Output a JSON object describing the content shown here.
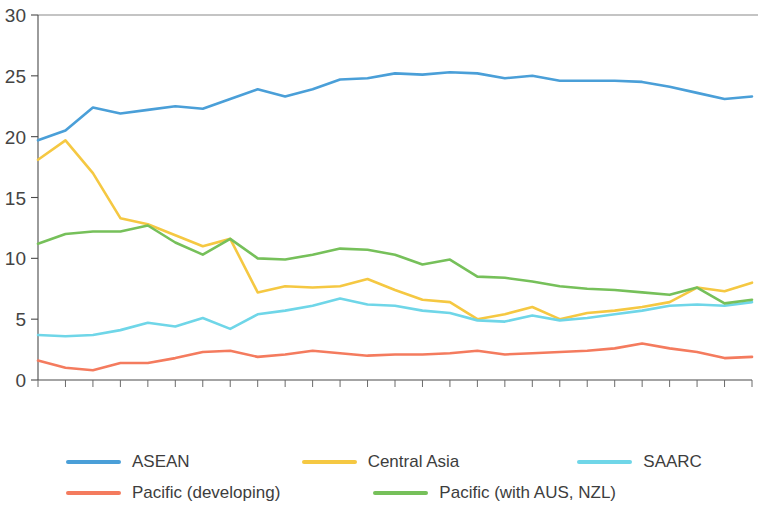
{
  "chart_data": {
    "type": "line",
    "title": "",
    "xlabel": "",
    "ylabel": "",
    "ylim": [
      0,
      30
    ],
    "y_ticks": [
      0,
      5,
      10,
      15,
      20,
      25,
      30
    ],
    "grid": false,
    "legend_position": "bottom",
    "categories": [
      "1992",
      "1993",
      "1994",
      "1995",
      "1996",
      "1997",
      "1998",
      "1999",
      "2000",
      "2001",
      "2002",
      "2003",
      "2004",
      "2005",
      "2006",
      "2007",
      "2008",
      "2009",
      "2010",
      "2011",
      "2012",
      "2013",
      "2014",
      "2015",
      "2016",
      "2017",
      "2018"
    ],
    "series": [
      {
        "name": "ASEAN",
        "color": "#4a9fd8",
        "values": [
          19.7,
          20.5,
          22.4,
          21.9,
          22.2,
          22.5,
          22.3,
          23.1,
          23.9,
          23.3,
          23.9,
          24.7,
          24.8,
          25.2,
          25.1,
          25.3,
          25.2,
          24.8,
          25.0,
          24.6,
          24.6,
          24.6,
          24.5,
          24.1,
          23.6,
          23.1,
          23.3
        ]
      },
      {
        "name": "Central Asia",
        "color": "#f5c842",
        "values": [
          18.1,
          19.7,
          17.0,
          13.3,
          12.8,
          11.9,
          11.0,
          11.6,
          7.2,
          7.7,
          7.6,
          7.7,
          8.3,
          7.4,
          6.6,
          6.4,
          5.0,
          5.4,
          6.0,
          5.0,
          5.5,
          5.7,
          6.0,
          6.4,
          7.6,
          7.3,
          8.0
        ]
      },
      {
        "name": "SAARC",
        "color": "#6fd6e8",
        "values": [
          3.7,
          3.6,
          3.7,
          4.1,
          4.7,
          4.4,
          5.1,
          4.2,
          5.4,
          5.7,
          6.1,
          6.7,
          6.2,
          6.1,
          5.7,
          5.5,
          4.9,
          4.8,
          5.3,
          4.9,
          5.1,
          5.4,
          5.7,
          6.1,
          6.2,
          6.1,
          6.4
        ]
      },
      {
        "name": "Pacific (developing)",
        "color": "#f47b5e",
        "values": [
          1.6,
          1.0,
          0.8,
          1.4,
          1.4,
          1.8,
          2.3,
          2.4,
          1.9,
          2.1,
          2.4,
          2.2,
          2.0,
          2.1,
          2.1,
          2.2,
          2.4,
          2.1,
          2.2,
          2.3,
          2.4,
          2.6,
          3.0,
          2.6,
          2.3,
          1.8,
          1.9
        ]
      },
      {
        "name": "Pacific (with AUS, NZL)",
        "color": "#76c05a",
        "values": [
          11.2,
          12.0,
          12.2,
          12.2,
          12.7,
          11.3,
          10.3,
          11.6,
          10.0,
          9.9,
          10.3,
          10.8,
          10.7,
          10.3,
          9.5,
          9.9,
          8.5,
          8.4,
          8.1,
          7.7,
          7.5,
          7.4,
          7.2,
          7.0,
          7.6,
          6.3,
          6.6
        ]
      }
    ]
  },
  "legend": {
    "items": [
      {
        "label": "ASEAN",
        "color": "#4a9fd8"
      },
      {
        "label": "Central Asia",
        "color": "#f5c842"
      },
      {
        "label": "SAARC",
        "color": "#6fd6e8"
      },
      {
        "label": "Pacific (developing)",
        "color": "#f47b5e"
      },
      {
        "label": "Pacific (with AUS, NZL)",
        "color": "#76c05a"
      }
    ]
  },
  "axes": {
    "y_max_label": "30",
    "y_min_label": "0"
  }
}
